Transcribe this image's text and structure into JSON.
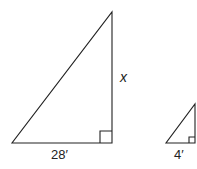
{
  "diagram": {
    "large_triangle": {
      "base_label": "28′",
      "height_label": "x"
    },
    "small_triangle": {
      "base_label": "4′",
      "height_label": ""
    },
    "colors": {
      "stroke": "#222222",
      "background": "#ffffff"
    }
  }
}
